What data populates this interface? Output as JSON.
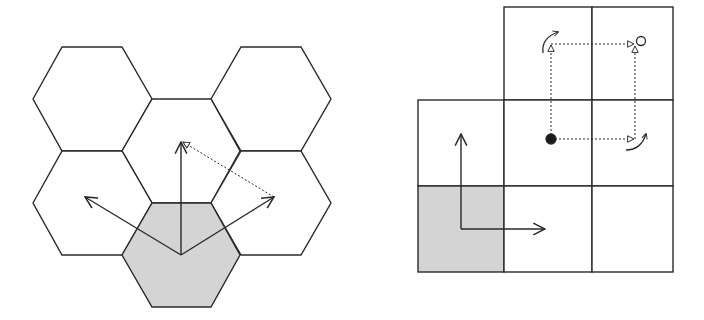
{
  "figure": {
    "colors": {
      "stroke": "#2a2a2a",
      "shaded_cell": "#d4d4d4",
      "background": "#ffffff"
    }
  },
  "hex_panel": {
    "label": "hexagonal-grid",
    "cells": [
      {
        "id": "top-left",
        "cx": 92,
        "cy": 99,
        "shaded": false
      },
      {
        "id": "top-right",
        "cx": 271,
        "cy": 99,
        "shaded": false
      },
      {
        "id": "center",
        "cx": 181,
        "cy": 151,
        "shaded": false
      },
      {
        "id": "mid-left",
        "cx": 92,
        "cy": 203,
        "shaded": false
      },
      {
        "id": "mid-right",
        "cx": 271,
        "cy": 203,
        "shaded": false
      },
      {
        "id": "origin",
        "cx": 181,
        "cy": 255,
        "shaded": true
      }
    ],
    "arrows": [
      {
        "id": "arrow-up",
        "style": "solid",
        "from": [
          181,
          255
        ],
        "to": [
          181,
          141
        ]
      },
      {
        "id": "arrow-upleft",
        "style": "solid",
        "from": [
          181,
          255
        ],
        "to": [
          85,
          197
        ]
      },
      {
        "id": "arrow-upright",
        "style": "solid",
        "from": [
          181,
          255
        ],
        "to": [
          274,
          197
        ]
      },
      {
        "id": "arrow-dotted",
        "style": "dotted",
        "from": [
          274,
          197
        ],
        "to": [
          181,
          141
        ]
      }
    ]
  },
  "grid_panel": {
    "label": "square-grid",
    "cells": [
      {
        "id": "r0c1",
        "row": 0,
        "col": 1,
        "shaded": false
      },
      {
        "id": "r0c2",
        "row": 0,
        "col": 2,
        "shaded": false
      },
      {
        "id": "r1c0",
        "row": 1,
        "col": 0,
        "shaded": false
      },
      {
        "id": "r1c1",
        "row": 1,
        "col": 1,
        "shaded": false
      },
      {
        "id": "r1c2",
        "row": 1,
        "col": 2,
        "shaded": false
      },
      {
        "id": "r2c0",
        "row": 2,
        "col": 0,
        "shaded": true
      },
      {
        "id": "r2c1",
        "row": 2,
        "col": 1,
        "shaded": false
      },
      {
        "id": "r2c2",
        "row": 2,
        "col": 2,
        "shaded": false
      }
    ],
    "arrows": [
      {
        "id": "arrow-up",
        "style": "solid",
        "from": [
          461,
          229
        ],
        "to": [
          461,
          134
        ]
      },
      {
        "id": "arrow-right",
        "style": "solid",
        "from": [
          461,
          229
        ],
        "to": [
          545,
          229
        ]
      },
      {
        "id": "path-up",
        "style": "dotted",
        "from": [
          551,
          139
        ],
        "to": [
          551,
          44
        ]
      },
      {
        "id": "path-right-top",
        "style": "dotted",
        "from": [
          551,
          44
        ],
        "to": [
          634,
          44
        ]
      },
      {
        "id": "path-right-bottom",
        "style": "dotted",
        "from": [
          551,
          139
        ],
        "to": [
          633,
          139
        ]
      },
      {
        "id": "path-up-right",
        "style": "dotted",
        "from": [
          635,
          139
        ],
        "to": [
          635,
          48
        ]
      }
    ],
    "markers": [
      {
        "id": "start-dot",
        "type": "filled-circle",
        "cx": 551,
        "cy": 139
      },
      {
        "id": "goal-circle",
        "type": "open-circle",
        "cx": 641,
        "cy": 41
      }
    ],
    "turn_arrows": [
      {
        "id": "turn-top-left",
        "at": [
          549,
          42
        ]
      },
      {
        "id": "turn-bottom-right",
        "at": [
          640,
          144
        ]
      }
    ]
  }
}
